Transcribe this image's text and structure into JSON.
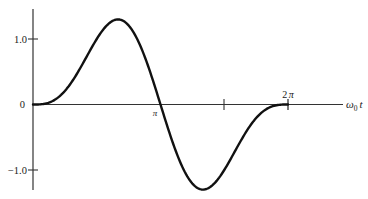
{
  "chart_data": {
    "type": "line",
    "title": "",
    "xlabel": "ω0 t",
    "ylabel": "",
    "xlim": [
      0,
      8.0
    ],
    "ylim": [
      -1.32,
      1.45
    ],
    "grid": false,
    "legend": null,
    "x_ticks": [
      {
        "value": 3.14159,
        "label": "π"
      },
      {
        "value": 4.71239,
        "label": ""
      },
      {
        "value": 6.28319,
        "label": "2π"
      }
    ],
    "y_ticks": [
      {
        "value": 1.0,
        "label": "1.0"
      },
      {
        "value": 0,
        "label": "0"
      },
      {
        "value": -1.0,
        "label": "−1.0"
      }
    ],
    "series": [
      {
        "name": "response",
        "description": "single-cycle pulse: sin(ω0t) − ½·sin(2ω0t) for 0 ≤ ω0t ≤ 2π, zero outside",
        "x": [
          0,
          0.3927,
          0.7854,
          1.1781,
          1.5708,
          1.9635,
          2.0944,
          2.3562,
          2.7489,
          3.1416,
          3.5343,
          3.927,
          4.1888,
          4.3197,
          4.7124,
          5.1051,
          5.4978,
          5.8905,
          6.2832
        ],
        "values": [
          0,
          0.029,
          0.2071,
          0.5702,
          1.0,
          1.2774,
          1.299,
          1.2071,
          0.6755,
          0,
          -0.6755,
          -1.2071,
          -1.299,
          -1.2774,
          -1.0,
          -0.5702,
          -0.2071,
          -0.029,
          0
        ]
      }
    ],
    "annotations": [
      {
        "text": "π",
        "at": "x-axis crossing"
      },
      {
        "text": "2π",
        "at": "end of pulse"
      }
    ]
  },
  "labels": {
    "y_tick_top": "1.0",
    "y_tick_zero": "0",
    "y_tick_bottom": "−1.0",
    "x_tick_pi": "π",
    "x_tick_2pi_num": "2",
    "x_tick_2pi_sym": "π",
    "x_axis_omega": "ω",
    "x_axis_sub": "0",
    "x_axis_t": "t"
  },
  "colors": {
    "curve": "#111111",
    "axis": "#333333",
    "background": "#ffffff"
  }
}
